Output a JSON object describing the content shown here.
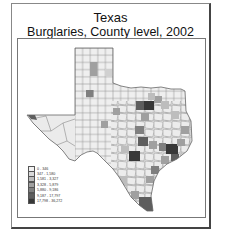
{
  "title": {
    "line1": "Texas",
    "line2": "Burglaries, County level, 2002"
  },
  "legend": {
    "items": [
      {
        "label": "0 - 346",
        "color": "#f2f2f2"
      },
      {
        "label": "347 - 1,580",
        "color": "#d9d9d9"
      },
      {
        "label": "1,581 - 3,327",
        "color": "#bdbdbd"
      },
      {
        "label": "3,328 - 5,879",
        "color": "#a0a0a0"
      },
      {
        "label": "5,880 - 9,186",
        "color": "#7f7f7f"
      },
      {
        "label": "9,187 - 17,797",
        "color": "#5e5e5e"
      },
      {
        "label": "17,798 - 36,272",
        "color": "#383838"
      }
    ]
  },
  "map": {
    "region": "Texas counties",
    "highlighted": [
      {
        "name": "Dallas area",
        "class": 7
      },
      {
        "name": "Harris (Houston) area",
        "class": 7
      },
      {
        "name": "Bexar (San Antonio) area",
        "class": 7
      },
      {
        "name": "Travis (Austin) area",
        "class": 6
      },
      {
        "name": "Tarrant area",
        "class": 6
      },
      {
        "name": "Hidalgo / Cameron area",
        "class": 6
      },
      {
        "name": "El Paso",
        "class": 6
      },
      {
        "name": "Potter area",
        "class": 4
      },
      {
        "name": "Lubbock area",
        "class": 4
      },
      {
        "name": "Nueces area",
        "class": 5
      }
    ]
  }
}
